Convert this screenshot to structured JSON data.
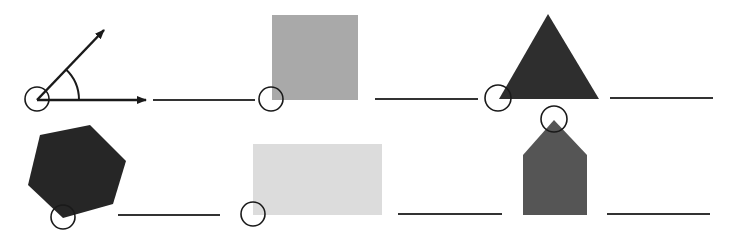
{
  "worksheet": {
    "description": "Angle identification exercise: a marked angle example followed by five shapes with circled vertex and a blank answer line",
    "colors": {
      "stroke": "#1a1a1a",
      "square_fill": "#a9a9a9",
      "triangle_fill": "#2e2e2e",
      "hexagon_fill": "#262626",
      "rectangle_fill": "#dcdcdc",
      "pentagon_fill": "#555555",
      "background": "#ffffff"
    },
    "items": [
      {
        "id": "example-angle",
        "shape": "angle",
        "answer": ""
      },
      {
        "id": "square",
        "shape": "square",
        "answer": ""
      },
      {
        "id": "triangle",
        "shape": "triangle",
        "answer": ""
      },
      {
        "id": "hexagon",
        "shape": "hexagon",
        "answer": ""
      },
      {
        "id": "rectangle",
        "shape": "rectangle",
        "answer": ""
      },
      {
        "id": "pentagon",
        "shape": "pentagon",
        "answer": ""
      }
    ]
  }
}
